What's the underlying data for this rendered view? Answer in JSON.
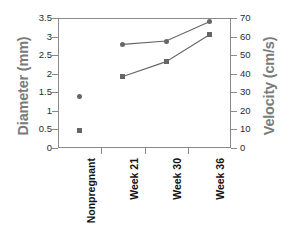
{
  "chart_data": {
    "type": "line",
    "title": "",
    "xlabel": "",
    "categories": [
      "Nonpregnant",
      "Week 21",
      "Week 30",
      "Week 36"
    ],
    "grid": false,
    "legend": "none",
    "axes": {
      "left": {
        "label": "Diameter (mm)",
        "ylim": [
          0,
          3.5
        ],
        "tick_step": 0.5,
        "ticks": [
          "0",
          "0.5",
          "1",
          "1.5",
          "2",
          "2.5",
          "3",
          "3.5"
        ],
        "tick_values": [
          0,
          0.5,
          1,
          1.5,
          2,
          2.5,
          3,
          3.5
        ]
      },
      "right": {
        "label": "Velocity (cm/s)",
        "ylim": [
          0,
          70
        ],
        "tick_step": 10,
        "ticks": [
          "0",
          "10",
          "20",
          "30",
          "40",
          "50",
          "60",
          "70"
        ],
        "tick_values": [
          0,
          10,
          20,
          30,
          40,
          50,
          60,
          70
        ]
      }
    },
    "series": [
      {
        "name": "Diameter",
        "marker": "circle",
        "axis": "left",
        "color": "#666666",
        "connected_from_index": 1,
        "values": [
          1.4,
          2.79,
          2.88,
          3.4
        ]
      },
      {
        "name": "Velocity",
        "marker": "square",
        "axis": "right",
        "color": "#666666",
        "connected_from_index": 1,
        "values": [
          9.5,
          38.5,
          46.5,
          61.0
        ]
      }
    ]
  },
  "colors": {
    "marker": "#666666",
    "axis_title": "#7a7a7a",
    "frame": "#8a8a8a",
    "tick_text": "#2b2b2b",
    "category_text": "#141414",
    "background": "#ffffff"
  }
}
